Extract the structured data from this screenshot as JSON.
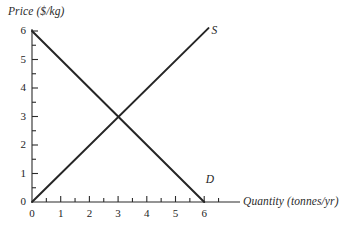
{
  "chart_data": {
    "type": "line",
    "title": "",
    "xlabel": "Quantity (tonnes/yr)",
    "ylabel": "Price ($/kg)",
    "xlim": [
      0,
      6.5
    ],
    "ylim": [
      0,
      6.2
    ],
    "grid": false,
    "legend_position": "inline-curve-labels",
    "x_ticks_major": [
      0,
      1,
      2,
      3,
      4,
      5,
      6
    ],
    "x_tick_labels": [
      "0",
      "1",
      "2",
      "3",
      "4",
      "5",
      "6"
    ],
    "x_ticks_minor": [
      0.5,
      1.5,
      2.5,
      3.5,
      4.5,
      5.5,
      6.5
    ],
    "y_ticks_major": [
      0,
      1,
      2,
      3,
      4,
      5,
      6
    ],
    "y_tick_labels": [
      "0",
      "1",
      "2",
      "3",
      "4",
      "5",
      "6"
    ],
    "y_ticks_minor": [
      0.5,
      1.5,
      2.5,
      3.5,
      4.5,
      5.5
    ],
    "series": [
      {
        "name": "S",
        "label": "S",
        "description": "supply curve",
        "color": "#262626",
        "x": [
          0,
          6.15
        ],
        "y": [
          0,
          6.1
        ],
        "label_at": {
          "x": 6.25,
          "y": 5.95
        }
      },
      {
        "name": "D",
        "label": "D",
        "description": "demand curve",
        "color": "#262626",
        "x": [
          0,
          6
        ],
        "y": [
          6,
          0
        ],
        "label_at": {
          "x": 6.05,
          "y": 0.72
        }
      }
    ],
    "annotations": [
      {
        "name": "equilibrium",
        "x": 3,
        "y": 3,
        "text": ""
      }
    ],
    "axis_color": "#2b2b2b",
    "line_color": "#262626",
    "background": "#ffffff"
  }
}
